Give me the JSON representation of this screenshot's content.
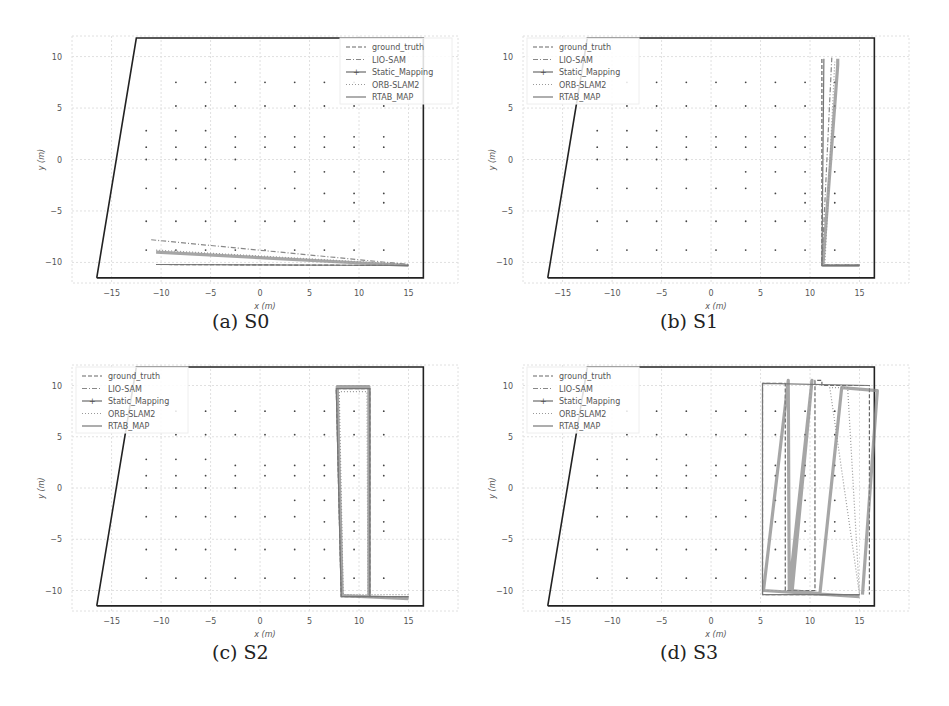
{
  "figure": {
    "panels": [
      {
        "id": "a",
        "caption": "(a) S0",
        "legend_position": "upper right"
      },
      {
        "id": "b",
        "caption": "(b) S1",
        "legend_position": "upper left"
      },
      {
        "id": "c",
        "caption": "(c) S2",
        "legend_position": "upper left"
      },
      {
        "id": "d",
        "caption": "(d) S3",
        "legend_position": "upper left"
      }
    ],
    "xlabel": "x (m)",
    "ylabel": "y (m)",
    "xticks": [
      "−15",
      "−10",
      "−5",
      "0",
      "5",
      "10",
      "15"
    ],
    "yticks": [
      "10",
      "5",
      "0",
      "−5",
      "−10"
    ],
    "legend": [
      "ground_truth",
      "LIO-SAM",
      "Static_Mapping",
      "ORB-SLAM2",
      "RTAB_MAP"
    ],
    "colors": {
      "trajectory": "#777777",
      "frame": "#222222",
      "grid": "#e0e0e0",
      "text": "#555555"
    }
  },
  "chart_data": [
    {
      "type": "line",
      "title": "(a) S0",
      "xlabel": "x (m)",
      "ylabel": "y (m)",
      "xlim": [
        -19,
        20
      ],
      "ylim": [
        -12,
        12
      ],
      "grid": true,
      "legend_position": "upper right",
      "legend": [
        "ground_truth",
        "LIO-SAM",
        "Static_Mapping",
        "ORB-SLAM2",
        "RTAB_MAP"
      ],
      "boundary": {
        "x": [
          -16.5,
          -12.5,
          16.5,
          16.5,
          -16.5
        ],
        "y": [
          -11.5,
          11.8,
          11.8,
          -11.5,
          -11.5
        ]
      },
      "series": [
        {
          "name": "ground_truth",
          "x": [
            -10.5,
            15
          ],
          "y": [
            -10.2,
            -10.3
          ]
        },
        {
          "name": "LIO-SAM",
          "x": [
            -11,
            15
          ],
          "y": [
            -7.8,
            -10.2
          ]
        },
        {
          "name": "Static_Mapping",
          "x": [
            -10.5,
            15
          ],
          "y": [
            -9,
            -10.3
          ]
        },
        {
          "name": "ORB-SLAM2",
          "x": [
            -10.5,
            15
          ],
          "y": [
            -8.8,
            -10.2
          ]
        },
        {
          "name": "RTAB_MAP",
          "x": [
            -10.5,
            15
          ],
          "y": [
            -10.2,
            -10.3
          ]
        }
      ]
    },
    {
      "type": "line",
      "title": "(b) S1",
      "xlabel": "x (m)",
      "ylabel": "y (m)",
      "xlim": [
        -19,
        20
      ],
      "ylim": [
        -12,
        12
      ],
      "grid": true,
      "legend_position": "upper left",
      "legend": [
        "ground_truth",
        "LIO-SAM",
        "Static_Mapping",
        "ORB-SLAM2",
        "RTAB_MAP"
      ],
      "boundary": {
        "x": [
          -16.5,
          -12.5,
          16.5,
          16.5,
          -16.5
        ],
        "y": [
          -11.5,
          11.8,
          11.8,
          -11.5,
          -11.5
        ]
      },
      "series": [
        {
          "name": "ground_truth",
          "x": [
            15,
            11.2,
            11.2
          ],
          "y": [
            -10.3,
            -10.3,
            9.8
          ]
        },
        {
          "name": "Static_Mapping",
          "x": [
            15,
            11.3,
            12.8,
            12.8
          ],
          "y": [
            -10.3,
            -10.3,
            9.2,
            9.8
          ]
        },
        {
          "name": "LIO-SAM",
          "x": [
            15,
            11.2,
            12.2
          ],
          "y": [
            -10.2,
            -10.2,
            9.9
          ]
        },
        {
          "name": "ORB-SLAM2",
          "x": [
            15,
            11.5,
            12.5
          ],
          "y": [
            -10.2,
            -10.2,
            9.5
          ]
        },
        {
          "name": "RTAB_MAP",
          "x": [
            15,
            11.2,
            11.4
          ],
          "y": [
            -10.3,
            -10.3,
            9.8
          ]
        }
      ]
    },
    {
      "type": "line",
      "title": "(c) S2",
      "xlabel": "x (m)",
      "ylabel": "y (m)",
      "xlim": [
        -19,
        20
      ],
      "ylim": [
        -12,
        12
      ],
      "grid": true,
      "legend_position": "upper left",
      "legend": [
        "ground_truth",
        "LIO-SAM",
        "Static_Mapping",
        "ORB-SLAM2",
        "RTAB_MAP"
      ],
      "boundary": {
        "x": [
          -16.5,
          -12.5,
          16.5,
          16.5,
          -16.5
        ],
        "y": [
          -11.5,
          11.8,
          11.8,
          -11.5,
          -11.5
        ]
      },
      "series": [
        {
          "name": "ground_truth",
          "x": [
            15,
            8.2,
            7.7,
            11.1,
            11.1
          ],
          "y": [
            -10.6,
            -10.6,
            9.7,
            9.7,
            -10.6
          ]
        },
        {
          "name": "Static_Mapping",
          "x": [
            15,
            8.3,
            7.8,
            11.0,
            11.0
          ],
          "y": [
            -10.8,
            -10.5,
            9.9,
            9.9,
            -10.5
          ]
        },
        {
          "name": "ORB-SLAM2",
          "x": [
            15,
            8.4,
            8.0,
            10.8,
            10.9
          ],
          "y": [
            -10.4,
            -10.4,
            9.4,
            9.4,
            -10.4
          ]
        },
        {
          "name": "RTAB_MAP",
          "x": [
            15,
            8.2,
            7.7,
            11.1,
            11.1
          ],
          "y": [
            -10.6,
            -10.6,
            9.7,
            9.7,
            -10.6
          ]
        }
      ]
    },
    {
      "type": "line",
      "title": "(d) S3",
      "xlabel": "x (m)",
      "ylabel": "y (m)",
      "xlim": [
        -19,
        20
      ],
      "ylim": [
        -12,
        12
      ],
      "grid": true,
      "legend_position": "upper left",
      "legend": [
        "ground_truth",
        "LIO-SAM",
        "Static_Mapping",
        "ORB-SLAM2",
        "RTAB_MAP"
      ],
      "boundary": {
        "x": [
          -16.5,
          -12.5,
          16.5,
          16.5,
          -16.5
        ],
        "y": [
          -11.5,
          11.8,
          11.8,
          -11.5,
          -11.5
        ]
      },
      "series": [
        {
          "name": "ground_truth",
          "x": [
            15,
            5.2,
            5.2,
            7.5,
            7.5,
            10.5,
            10.5,
            11.2,
            11.2,
            16,
            16
          ],
          "y": [
            -10.4,
            -10.4,
            10.2,
            10.2,
            -10.0,
            -10.0,
            10.5,
            10.5,
            10.0,
            10.0,
            -10.4
          ]
        },
        {
          "name": "Static_Mapping",
          "x": [
            15,
            5.3,
            7.8,
            7.9,
            10.2,
            8.2,
            11.0,
            13.2,
            16.8,
            15.3
          ],
          "y": [
            -10.6,
            -10.0,
            10.5,
            -10.0,
            10.5,
            -10.0,
            -10.3,
            9.8,
            9.5,
            -10.4
          ]
        },
        {
          "name": "ORB-SLAM2",
          "x": [
            15,
            13.8,
            12.0,
            15.0
          ],
          "y": [
            -10.4,
            9.8,
            9.8,
            -10.4
          ]
        },
        {
          "name": "RTAB_MAP",
          "x": [
            15,
            5.2,
            5.2,
            16
          ],
          "y": [
            -10.4,
            -10.4,
            10.2,
            10.0
          ]
        }
      ]
    }
  ]
}
